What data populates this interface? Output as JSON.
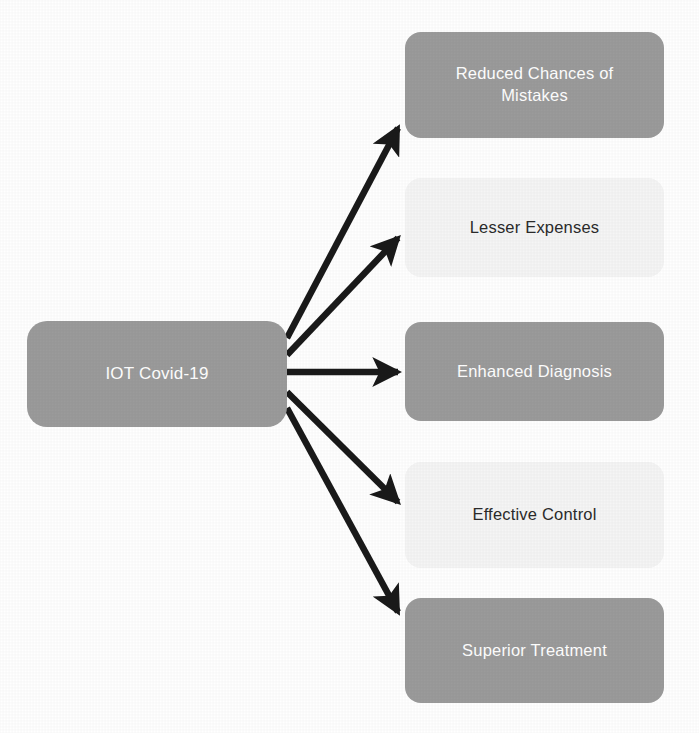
{
  "diagram": {
    "type": "radial-flow",
    "background_color": "#ffffff",
    "arrow_color": "#1a1a1a",
    "central_node": {
      "id": "central",
      "label": "IOT Covid-19",
      "fill_color": "#9b9b9b",
      "text_color": "#ffffff",
      "shape": "rounded-rectangle"
    },
    "outcome_nodes": [
      {
        "id": "reduced-chances-of-mistakes",
        "label": "Reduced Chances of\nMistakes",
        "style": "filled",
        "fill_color": "#9b9b9b",
        "text_color": "#ffffff",
        "shape": "rounded-rectangle"
      },
      {
        "id": "lesser-expenses",
        "label": "Lesser Expenses",
        "style": "light",
        "fill_color": "#f5f5f5",
        "text_color": "#2b2b2b",
        "shape": "rounded-rectangle"
      },
      {
        "id": "enhanced-diagnosis",
        "label": "Enhanced Diagnosis",
        "style": "filled",
        "fill_color": "#9b9b9b",
        "text_color": "#ffffff",
        "shape": "rounded-rectangle"
      },
      {
        "id": "effective-control",
        "label": "Effective Control",
        "style": "light",
        "fill_color": "#f5f5f5",
        "text_color": "#2b2b2b",
        "shape": "rounded-rectangle"
      },
      {
        "id": "superior-treatment",
        "label": "Superior Treatment",
        "style": "filled",
        "fill_color": "#9b9b9b",
        "text_color": "#ffffff",
        "shape": "rounded-rectangle"
      }
    ],
    "connections": [
      {
        "from": "central",
        "to": "reduced-chances-of-mistakes",
        "arrow": "single-headed"
      },
      {
        "from": "central",
        "to": "lesser-expenses",
        "arrow": "single-headed"
      },
      {
        "from": "central",
        "to": "enhanced-diagnosis",
        "arrow": "single-headed"
      },
      {
        "from": "central",
        "to": "effective-control",
        "arrow": "single-headed"
      },
      {
        "from": "central",
        "to": "superior-treatment",
        "arrow": "single-headed"
      }
    ],
    "caption_remnant": ""
  }
}
